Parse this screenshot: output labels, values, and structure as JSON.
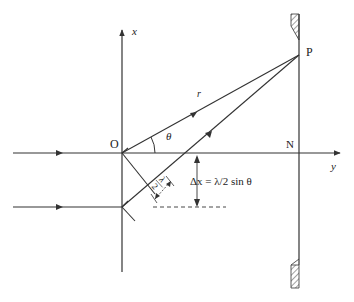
{
  "diagram": {
    "labels": {
      "x_axis": "x",
      "y_axis": "y",
      "origin": "O",
      "point_p": "P",
      "point_n": "N",
      "radius": "r",
      "angle": "θ",
      "delta_x": "Δx = λ/2 sin θ",
      "half_wavelength_num": "λ",
      "half_wavelength_den": "2"
    },
    "colors": {
      "line": "#333333",
      "background": "#ffffff"
    }
  }
}
